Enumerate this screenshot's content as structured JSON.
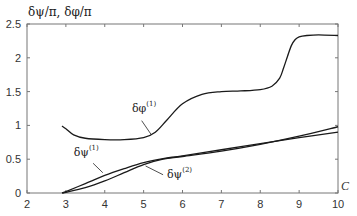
{
  "chart_data": {
    "type": "line",
    "title": "",
    "xlabel": "C",
    "ylabel": "δψ/π, δφ/π",
    "xlim": [
      2,
      10
    ],
    "ylim": [
      0,
      2.5
    ],
    "xticks": [
      2,
      3,
      4,
      5,
      6,
      7,
      8,
      9,
      10
    ],
    "yticks": [
      0,
      0.5,
      1,
      1.5,
      2,
      2.5
    ],
    "xtick_labels": [
      "2",
      "3",
      "4",
      "5",
      "6",
      "7",
      "8",
      "9",
      "10"
    ],
    "ytick_labels": [
      "0",
      "0.5",
      "1",
      "1.5",
      "2",
      "2.5"
    ],
    "grid": false,
    "legend": "none (inline annotations)",
    "series": [
      {
        "name": "δφ(1)",
        "x": [
          2.9,
          3.0,
          3.2,
          3.5,
          4.0,
          4.5,
          5.0,
          5.3,
          5.6,
          6.0,
          6.5,
          7.0,
          7.5,
          8.0,
          8.3,
          8.5,
          8.6,
          8.7,
          8.8,
          8.9,
          9.0,
          9.2,
          9.5,
          10.0
        ],
        "values": [
          0.99,
          0.95,
          0.86,
          0.81,
          0.79,
          0.79,
          0.82,
          0.9,
          1.08,
          1.32,
          1.46,
          1.5,
          1.51,
          1.53,
          1.58,
          1.7,
          1.85,
          2.02,
          2.18,
          2.27,
          2.31,
          2.33,
          2.34,
          2.33
        ]
      },
      {
        "name": "δψ(1)",
        "x": [
          2.9,
          3.0,
          3.5,
          4.0,
          4.5,
          5.0,
          5.5,
          6.0,
          7.0,
          8.0,
          9.0,
          10.0
        ],
        "values": [
          0.0,
          0.02,
          0.14,
          0.26,
          0.36,
          0.45,
          0.51,
          0.55,
          0.64,
          0.73,
          0.82,
          0.9
        ]
      },
      {
        "name": "δψ(2)",
        "x": [
          2.9,
          3.0,
          3.5,
          4.0,
          4.5,
          5.0,
          5.5,
          6.0,
          7.0,
          8.0,
          9.0,
          10.0
        ],
        "values": [
          0.0,
          0.01,
          0.08,
          0.18,
          0.3,
          0.42,
          0.5,
          0.54,
          0.62,
          0.72,
          0.84,
          0.98
        ]
      }
    ],
    "annotations": [
      {
        "text": "δφ",
        "sup": "(1)",
        "x": 4.7,
        "y": 1.2,
        "points_to": "δφ(1)"
      },
      {
        "text": "δψ",
        "sup": "(1)",
        "x": 3.2,
        "y": 0.55,
        "points_to": "δψ(1)"
      },
      {
        "text": "δψ",
        "sup": "(2)",
        "x": 5.6,
        "y": 0.22,
        "points_to": "δψ(2)"
      }
    ],
    "line_color": "#1a1a1a"
  }
}
